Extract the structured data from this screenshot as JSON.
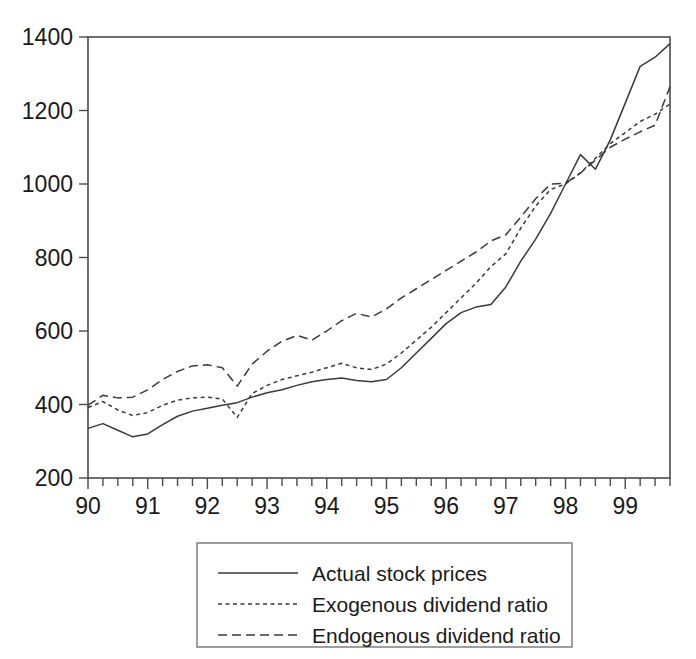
{
  "chart_data": {
    "type": "line",
    "title": "",
    "xlabel": "",
    "ylabel": "",
    "xlim": [
      1990.0,
      1999.75
    ],
    "ylim": [
      200,
      1400
    ],
    "grid": false,
    "legend_position": "below-center",
    "y_ticks": [
      200,
      400,
      600,
      800,
      1000,
      1200,
      1400
    ],
    "y_tick_labels": [
      "200",
      "400",
      "600",
      "800",
      "1000",
      "1200",
      "1400"
    ],
    "x_ticks": [
      1990,
      1991,
      1992,
      1993,
      1994,
      1995,
      1996,
      1997,
      1998,
      1999
    ],
    "x_tick_labels": [
      "90",
      "91",
      "92",
      "93",
      "94",
      "95",
      "96",
      "97",
      "98",
      "99"
    ],
    "x_minor_tick_interval": 0.25,
    "x": [
      1990.0,
      1990.25,
      1990.5,
      1990.75,
      1991.0,
      1991.25,
      1991.5,
      1991.75,
      1992.0,
      1992.25,
      1992.5,
      1992.75,
      1993.0,
      1993.25,
      1993.5,
      1993.75,
      1994.0,
      1994.25,
      1994.5,
      1994.75,
      1995.0,
      1995.25,
      1995.5,
      1995.75,
      1996.0,
      1996.25,
      1996.5,
      1996.75,
      1997.0,
      1997.25,
      1997.5,
      1997.75,
      1998.0,
      1998.25,
      1998.5,
      1998.75,
      1999.0,
      1999.25,
      1999.5,
      1999.75
    ],
    "series": [
      {
        "name": "Actual stock prices",
        "style": "solid",
        "values": [
          335,
          348,
          330,
          312,
          320,
          345,
          368,
          382,
          390,
          398,
          405,
          420,
          432,
          440,
          452,
          462,
          468,
          472,
          465,
          462,
          468,
          500,
          540,
          580,
          620,
          650,
          665,
          672,
          720,
          790,
          850,
          920,
          1000,
          1080,
          1040,
          1120,
          1220,
          1320,
          1345,
          1382
        ]
      },
      {
        "name": "Exogenous dividend ratio",
        "style": "dotted",
        "values": [
          392,
          408,
          385,
          370,
          378,
          398,
          412,
          418,
          420,
          415,
          365,
          430,
          452,
          468,
          478,
          488,
          500,
          512,
          500,
          495,
          510,
          540,
          575,
          610,
          650,
          690,
          730,
          775,
          810,
          880,
          940,
          985,
          1000,
          1030,
          1070,
          1110,
          1140,
          1170,
          1190,
          1218
        ]
      },
      {
        "name": "Endogenous dividend ratio",
        "style": "dashed",
        "values": [
          398,
          425,
          418,
          420,
          440,
          468,
          490,
          505,
          508,
          500,
          450,
          510,
          545,
          572,
          588,
          575,
          600,
          628,
          648,
          638,
          660,
          690,
          715,
          740,
          765,
          790,
          815,
          845,
          862,
          910,
          960,
          1000,
          1002,
          1030,
          1065,
          1100,
          1122,
          1142,
          1160,
          1265
        ]
      }
    ]
  },
  "legend": {
    "entries": [
      {
        "label": "Actual stock prices",
        "style": "solid"
      },
      {
        "label": "Exogenous dividend ratio",
        "style": "dotted"
      },
      {
        "label": "Endogenous dividend ratio",
        "style": "dashed"
      }
    ]
  },
  "colors": {
    "line": "#3a3a3a",
    "frame": "#4a4a4a",
    "text": "#1a1a1a",
    "background": "#ffffff"
  }
}
